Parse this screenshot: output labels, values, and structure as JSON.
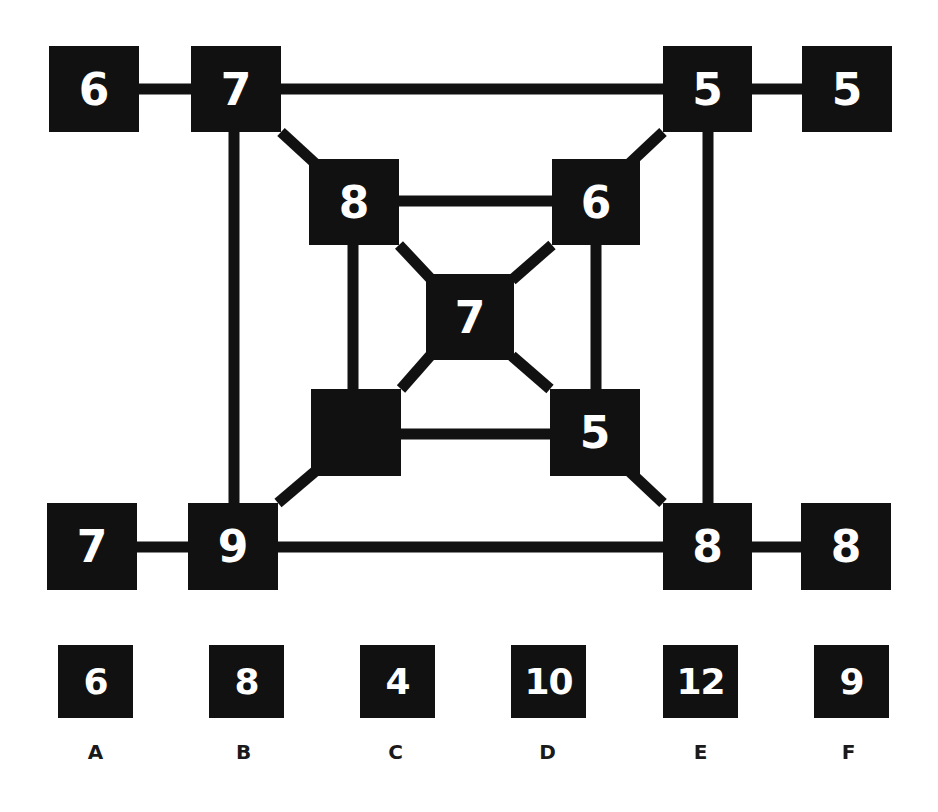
{
  "puzzle": {
    "type": "number-grid-missing-value",
    "nodes": {
      "outer_top_left_far": "6",
      "outer_top_left": "7",
      "outer_top_right": "5",
      "outer_top_right_far": "5",
      "inner_top_left": "8",
      "inner_top_right": "6",
      "center": "7",
      "inner_bottom_left": "",
      "inner_bottom_right": "5",
      "outer_bottom_left_far": "7",
      "outer_bottom_left": "9",
      "outer_bottom_right": "8",
      "outer_bottom_right_far": "8"
    },
    "options": [
      {
        "label": "A",
        "value": "6"
      },
      {
        "label": "B",
        "value": "8"
      },
      {
        "label": "C",
        "value": "4"
      },
      {
        "label": "D",
        "value": "10"
      },
      {
        "label": "E",
        "value": "12"
      },
      {
        "label": "F",
        "value": "9"
      }
    ],
    "colors": {
      "box": "#111111",
      "text": "#ffffff",
      "line": "#111111",
      "background": "#ffffff"
    }
  }
}
